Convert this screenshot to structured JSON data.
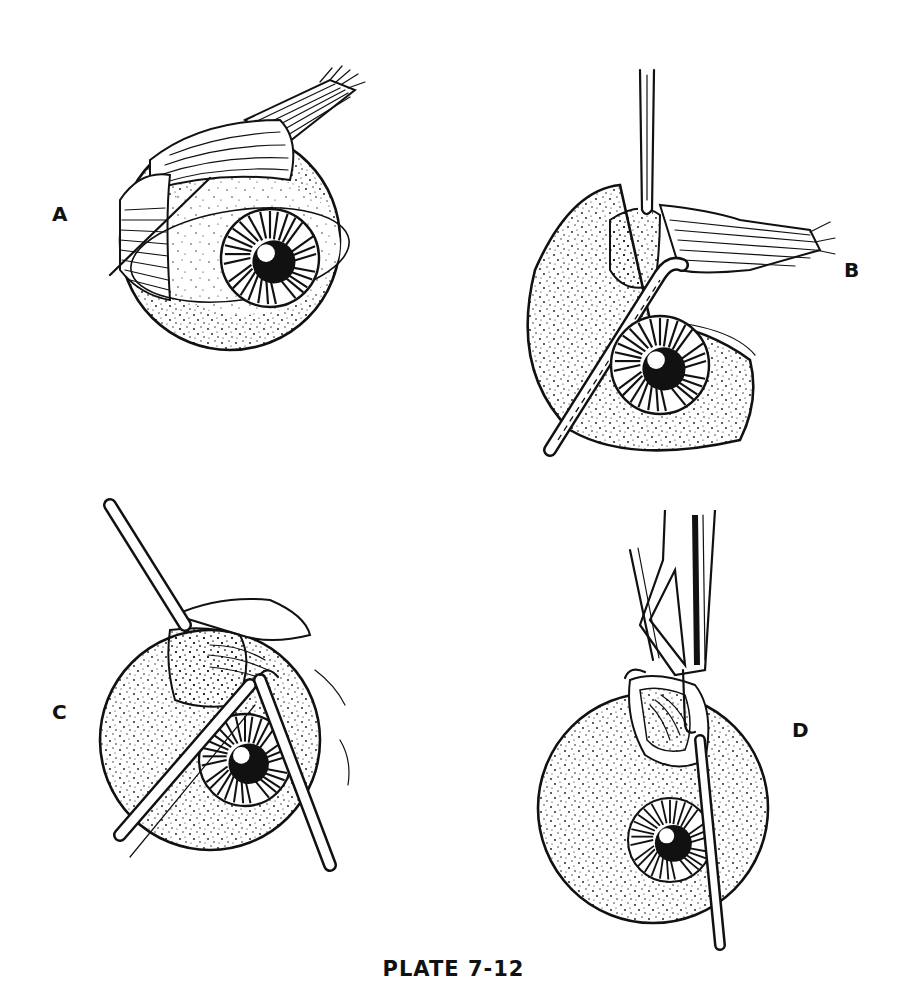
{
  "plate": {
    "caption": "PLATE 7-12",
    "colors": {
      "ink": "#111111",
      "paper": "#ffffff"
    },
    "panels": [
      {
        "id": "A",
        "label": "A",
        "subject": "globe with rectus muscle and suture loop around muscle"
      },
      {
        "id": "B",
        "label": "B",
        "subject": "muscle hook under rectus insertion with forceps above"
      },
      {
        "id": "C",
        "label": "C",
        "subject": "two instruments crossing over globe, muscle elevated"
      },
      {
        "id": "D",
        "label": "D",
        "subject": "clamp/forceps holding muscle with hook below"
      }
    ]
  }
}
